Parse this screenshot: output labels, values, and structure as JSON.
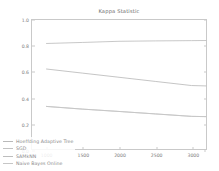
{
  "chart_data": {
    "type": "line",
    "title": "Kappa Statistic",
    "xlabel": "",
    "ylabel": "",
    "xlim": [
      800,
      3200
    ],
    "ylim": [
      0.0,
      1.0
    ],
    "xticks": [
      1000,
      1500,
      2000,
      2500,
      3000
    ],
    "xtick_labels": [
      "1000",
      "1500",
      "2000",
      "2500",
      "3000"
    ],
    "yticks": [
      0.0,
      0.2,
      0.4,
      0.6,
      0.8,
      1.0
    ],
    "ytick_labels": [
      "0.0",
      "0.2",
      "0.4",
      "0.6",
      "0.8",
      "1.0"
    ],
    "grid": false,
    "legend_position": "lower left",
    "x": [
      1000,
      1500,
      2000,
      2500,
      3000,
      3200
    ],
    "series": [
      {
        "name": "Hoeffding Adaptive Tree",
        "color": "#b9b9b9",
        "values": [
          0.62,
          0.588,
          0.556,
          0.524,
          0.492,
          0.489
        ]
      },
      {
        "name": "SGD",
        "color": "#c2c2c2",
        "values": [
          0.33,
          0.309,
          0.291,
          0.272,
          0.253,
          0.251
        ]
      },
      {
        "name": "SAMkNN",
        "color": "#bdbdbd",
        "values": [
          0.818,
          0.826,
          0.835,
          0.838,
          0.84,
          0.841
        ]
      },
      {
        "name": "Naive Bayes Online",
        "color": "#c6c6c6",
        "values": [
          0.33,
          0.309,
          0.291,
          0.272,
          0.253,
          0.251
        ]
      }
    ]
  },
  "colors": {
    "background": "#ffffff",
    "frame": "#c9c9c9",
    "tick_text": "#7c7c7c",
    "title_text": "#6e6e6e",
    "legend_text": "#8a8a8a"
  }
}
